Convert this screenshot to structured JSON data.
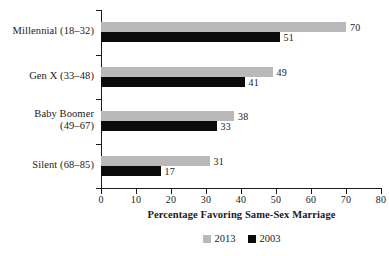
{
  "chart_data": {
    "type": "bar",
    "orientation": "horizontal",
    "title": "",
    "xlabel": "Percentage Favoring Same-Sex Marriage",
    "ylabel": "",
    "xlim": [
      0,
      80
    ],
    "xticks": [
      0,
      10,
      20,
      30,
      40,
      50,
      60,
      70,
      80
    ],
    "xtick_labels": [
      "0",
      "10",
      "20",
      "30",
      "40",
      "50",
      "60",
      "70",
      "80"
    ],
    "grid": false,
    "legend_position": "bottom",
    "categories": [
      "Millennial (18–32)",
      "Gen X (33–48)",
      "Baby Boomer (49–67)",
      "Silent (68–85)"
    ],
    "category_lines": [
      [
        "Millennial (18–32)"
      ],
      [
        "Gen X (33–48)"
      ],
      [
        "Baby Boomer",
        "(49–67)"
      ],
      [
        "Silent (68–85)"
      ]
    ],
    "series": [
      {
        "name": "2013",
        "color": "#b9b9b9",
        "values": [
          70,
          49,
          38,
          31
        ],
        "value_labels": [
          "70",
          "49",
          "38",
          "31"
        ]
      },
      {
        "name": "2003",
        "color": "#0b0b0b",
        "values": [
          51,
          41,
          33,
          17
        ],
        "value_labels": [
          "51",
          "41",
          "33",
          "17"
        ]
      }
    ]
  },
  "legend": {
    "items": [
      {
        "label": "2013",
        "color": "#b9b9b9"
      },
      {
        "label": "2003",
        "color": "#0b0b0b"
      }
    ]
  },
  "axis": {
    "x_title": "Percentage Favoring Same-Sex Marriage",
    "tick_labels": [
      "0",
      "10",
      "20",
      "30",
      "40",
      "50",
      "60",
      "70",
      "80"
    ]
  }
}
